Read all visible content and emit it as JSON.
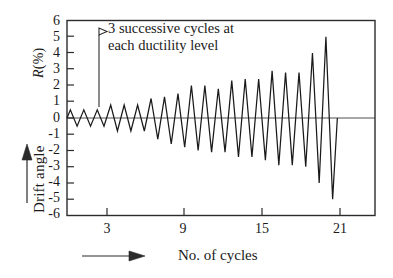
{
  "chart_data": {
    "type": "line",
    "title": "",
    "subtitle": "",
    "xlabel": "No. of  cycles",
    "ylabel": "Drift angle",
    "y_unit_label": "R(%)",
    "y_unit_symbol": "R",
    "y_unit_suffix": "(%)",
    "xlim": [
      0,
      22.9
    ],
    "ylim": [
      -6,
      6
    ],
    "xticks": [
      3,
      9,
      15,
      21
    ],
    "xtick_labels": [
      "3",
      "9",
      "15",
      "21"
    ],
    "yticks": [
      6,
      5,
      4,
      3,
      2,
      1,
      0,
      -1,
      -2,
      -3,
      -4,
      -5,
      -6
    ],
    "ytick_labels": [
      "6",
      "5",
      "4",
      "3",
      "2",
      "1",
      "0",
      "-1",
      "-2",
      "-3",
      "-4",
      "-5",
      "-6"
    ],
    "grid": false,
    "legend": "none",
    "series_name": "drift angle history",
    "series_color": "#1a1a1a",
    "zero_line": 0,
    "annotations": [
      {
        "name": "cycle-group-note",
        "line1": "3 successive cycles at",
        "line2": "each ductility level",
        "pointer": "triangle-arrowhead",
        "leader_from_cycle": 1.95,
        "leader_to_value": 0.95
      },
      {
        "name": "y-axis-direction-arrow",
        "glyph": "up-arrow"
      },
      {
        "name": "x-axis-direction-arrow",
        "glyph": "right-arrow"
      }
    ],
    "x": [
      0.0,
      0.25,
      0.75,
      1.25,
      1.75,
      2.25,
      2.75,
      3.25,
      3.75,
      4.25,
      4.75,
      5.25,
      5.75,
      6.25,
      6.75,
      7.25,
      7.75,
      8.25,
      8.75,
      9.25,
      9.75,
      10.25,
      10.75,
      11.25,
      11.75,
      12.25,
      12.75,
      13.25,
      13.75,
      14.25,
      14.75,
      15.25,
      15.75,
      16.25,
      16.75,
      17.25,
      17.75,
      18.25,
      18.75,
      19.25,
      19.75,
      20.1
    ],
    "values": [
      0.0,
      0.5,
      -0.5,
      0.5,
      -0.5,
      0.5,
      -0.5,
      0.8,
      -0.8,
      0.8,
      -0.8,
      0.8,
      -0.8,
      1.2,
      -1.3,
      1.3,
      -1.6,
      1.5,
      -1.8,
      2.0,
      -2.0,
      2.0,
      -2.1,
      1.8,
      -2.1,
      2.3,
      -2.4,
      2.4,
      -2.4,
      2.4,
      -2.6,
      2.9,
      -2.9,
      2.8,
      -2.9,
      2.8,
      -3.0,
      4.0,
      -4.0,
      5.0,
      -5.0,
      0.0
    ],
    "amplitude_steps": [
      0.5,
      0.8,
      1.3,
      1.8,
      2.1,
      2.4,
      2.9,
      4.0,
      5.0
    ],
    "cycles_per_step": 3
  },
  "axes": {
    "y_caption": "Drift angle",
    "y_unit": "R(%)"
  }
}
